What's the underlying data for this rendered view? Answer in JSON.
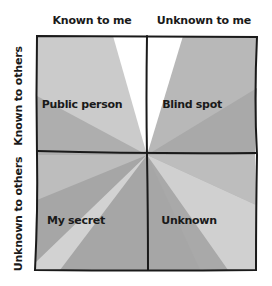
{
  "diagram": {
    "type": "johari-window",
    "columns": [
      {
        "label": "Known to me"
      },
      {
        "label": "Unknown to me"
      }
    ],
    "rows": [
      {
        "label": "Known to others"
      },
      {
        "label": "Unknown to others"
      }
    ],
    "quadrants": [
      {
        "label": "Public person",
        "position": "top-left"
      },
      {
        "label": "Blind spot",
        "position": "top-right"
      },
      {
        "label": "My secret",
        "position": "bottom-left"
      },
      {
        "label": "Unknown",
        "position": "bottom-right"
      }
    ],
    "colors": {
      "border": "#1a1a1a",
      "white": "#ffffff",
      "light": "#cbcbcb",
      "medium": "#b8b8b8",
      "dark": "#a6a6a6",
      "pale": "#d6d6d6"
    }
  }
}
